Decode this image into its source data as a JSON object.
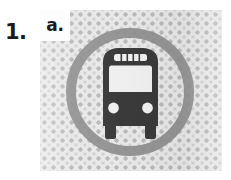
{
  "exercise": {
    "number_label": "1.",
    "item_label": "a."
  },
  "image_panel": {
    "alt_description": "bus-in-circle pictogram",
    "background_pattern": "halftone-diamond-texture",
    "background_color": "#e8e8e8",
    "pattern_color": "#b9b9b9"
  },
  "pictogram": {
    "icon_name": "bus-front-icon",
    "ring_name": "circle-ring",
    "ring_color": "#8e8e8e",
    "glyph_color": "#3a3a3a",
    "parts": {
      "destination_sign": "destination-sign",
      "windshield": "windshield",
      "body": "bus-body",
      "headlight_left": "headlight-left",
      "headlight_right": "headlight-right",
      "wheel_left": "wheel-left",
      "wheel_right": "wheel-right"
    }
  }
}
